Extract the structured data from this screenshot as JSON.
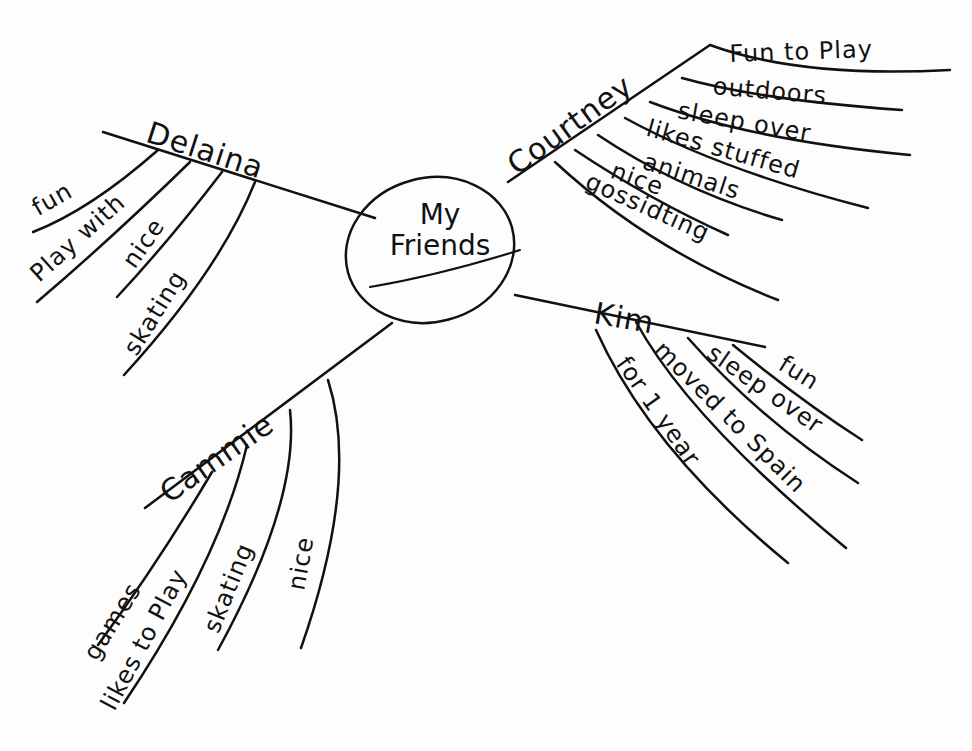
{
  "center": {
    "line1": "My",
    "line2": "Friends"
  },
  "branches": {
    "delaina": {
      "name": "Delaina",
      "items": [
        "fun",
        "Play with",
        "nice",
        "skating"
      ]
    },
    "courtney": {
      "name": "Courtney",
      "items": [
        "Fun to Play",
        "outdoors",
        "sleep over",
        "likes stuffed",
        "animals",
        "nice",
        "gossidting"
      ]
    },
    "kim": {
      "name": "Kim",
      "items": [
        "fun",
        "sleep over",
        "moved to Spain",
        "for 1 year"
      ]
    },
    "cammie": {
      "name": "Cammie",
      "items": [
        "games",
        "likes to Play",
        "skating",
        "nice"
      ]
    }
  },
  "colors": {
    "ink": "#111111",
    "paper": "#fdfdfd"
  }
}
